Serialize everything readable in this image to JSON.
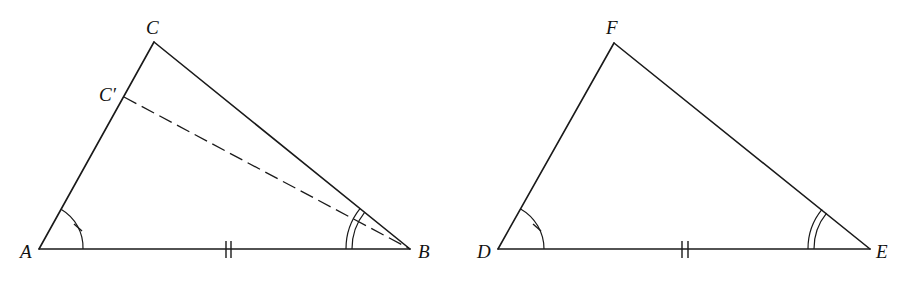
{
  "figure": {
    "triangle_left": {
      "vertices": {
        "A": {
          "label": "A",
          "x": 39,
          "y": 249
        },
        "B": {
          "label": "B",
          "x": 410,
          "y": 249
        },
        "C": {
          "label": "C",
          "x": 154,
          "y": 42
        },
        "C_prime": {
          "label": "C′",
          "x": 124,
          "y": 97
        }
      },
      "dashed_segment": "BC′",
      "angle_marks": {
        "A": "single arc with tick",
        "B": "double arc"
      },
      "side_marks": {
        "AB": "double tick"
      }
    },
    "triangle_right": {
      "vertices": {
        "D": {
          "label": "D",
          "x": 498,
          "y": 249
        },
        "E": {
          "label": "E",
          "x": 870,
          "y": 249
        },
        "F": {
          "label": "F",
          "x": 614,
          "y": 43
        }
      },
      "angle_marks": {
        "D": "single arc with tick",
        "E": "double arc"
      },
      "side_marks": {
        "DE": "double tick"
      }
    },
    "colors": {
      "stroke": "#1a1a1a",
      "background": "#ffffff"
    }
  }
}
